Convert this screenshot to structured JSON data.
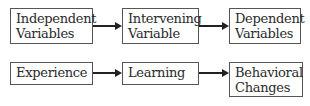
{
  "rows": [
    {
      "boxes": [
        {
          "label": "Independent\nVariables"
        },
        {
          "label": "Intervening\nVariable"
        },
        {
          "label": "Dependent\nVariables"
        }
      ]
    },
    {
      "boxes": [
        {
          "label": "Experience"
        },
        {
          "label": "Learning"
        },
        {
          "label": "Behavioral\nChanges"
        }
      ]
    }
  ]
}
